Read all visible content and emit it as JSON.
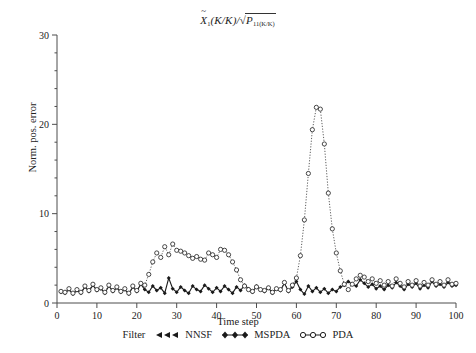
{
  "figure": {
    "title_plain": "X̂1(K/K)/√(P11(K/K))",
    "title_parts": {
      "var": "X",
      "var_sub": "1",
      "arg": "(K/K)/",
      "radical": "√",
      "rad_var": "P",
      "rad_sub": "11(K/K)"
    },
    "background_color": "#ffffff",
    "axis_color": "#4d4d4d"
  },
  "axes": {
    "xlabel": "Time step",
    "ylabel": "Norm. pos. error",
    "xticks": [
      0,
      10,
      20,
      30,
      40,
      50,
      60,
      70,
      80,
      90,
      100
    ],
    "yticks": [
      0,
      10,
      20,
      30
    ],
    "xlim": [
      0,
      100
    ],
    "ylim": [
      0,
      30
    ],
    "minor_tick_count_y": 5,
    "grid": "off"
  },
  "legend": {
    "prefix": "Filter",
    "entries": [
      {
        "marker": "triangle-left",
        "label": "NNSF",
        "color": "#1a1a1a"
      },
      {
        "marker": "diamond-filled",
        "label": "MSPDA",
        "color": "#1a1a1a"
      },
      {
        "marker": "circle-open",
        "label": "PDA",
        "color": "#1a1a1a"
      }
    ]
  },
  "chart_data": {
    "type": "line",
    "xlabel": "Time step",
    "ylabel": "Norm. pos. error",
    "xlim": [
      0,
      100
    ],
    "ylim": [
      0,
      30
    ],
    "xticks": [
      0,
      10,
      20,
      30,
      40,
      50,
      60,
      70,
      80,
      90,
      100
    ],
    "yticks": [
      0,
      10,
      20,
      30
    ],
    "grid": "off",
    "legend_position": "below-axes",
    "x": [
      1,
      2,
      3,
      4,
      5,
      6,
      7,
      8,
      9,
      10,
      11,
      12,
      13,
      14,
      15,
      16,
      17,
      18,
      19,
      20,
      21,
      22,
      23,
      24,
      25,
      26,
      27,
      28,
      29,
      30,
      31,
      32,
      33,
      34,
      35,
      36,
      37,
      38,
      39,
      40,
      41,
      42,
      43,
      44,
      45,
      46,
      47,
      48,
      49,
      50,
      51,
      52,
      53,
      54,
      55,
      56,
      57,
      58,
      59,
      60,
      61,
      62,
      63,
      64,
      65,
      66,
      67,
      68,
      69,
      70,
      71,
      72,
      73,
      74,
      75,
      76,
      77,
      78,
      79,
      80,
      81,
      82,
      83,
      84,
      85,
      86,
      87,
      88,
      89,
      90,
      91,
      92,
      93,
      94,
      95,
      96,
      97,
      98,
      99,
      100
    ],
    "series": [
      {
        "name": "MSPDA",
        "marker": "diamond-filled",
        "linestyle": "solid",
        "color": "#1a1a1a",
        "values": [
          1.2,
          1.1,
          1.5,
          1.0,
          1.4,
          1.1,
          1.8,
          1.3,
          2.0,
          1.4,
          1.6,
          1.1,
          1.9,
          1.3,
          1.7,
          1.2,
          1.5,
          1.0,
          1.8,
          1.3,
          2.1,
          1.5,
          1.2,
          1.9,
          1.4,
          1.7,
          1.1,
          2.8,
          1.6,
          1.2,
          1.8,
          1.4,
          1.1,
          1.9,
          1.5,
          1.3,
          2.0,
          1.6,
          1.2,
          1.7,
          1.3,
          1.9,
          1.5,
          1.1,
          1.8,
          1.4,
          2.0,
          1.6,
          1.2,
          1.9,
          1.5,
          1.3,
          1.7,
          1.1,
          1.6,
          1.4,
          2.2,
          1.3,
          1.8,
          2.4,
          1.5,
          1.0,
          1.9,
          1.3,
          1.7,
          1.2,
          1.6,
          1.1,
          1.5,
          1.3,
          1.8,
          2.0,
          2.4,
          2.1,
          1.9,
          2.6,
          2.2,
          1.8,
          2.1,
          1.6,
          1.9,
          1.5,
          2.0,
          1.7,
          2.3,
          1.9,
          1.5,
          2.1,
          1.8,
          2.2,
          1.6,
          2.0,
          1.7,
          2.4,
          1.9,
          2.1,
          1.8,
          2.3,
          1.9,
          2.0
        ]
      },
      {
        "name": "PDA",
        "marker": "circle-open",
        "linestyle": "dotted",
        "color": "#333333",
        "values": [
          1.3,
          1.2,
          1.6,
          1.1,
          1.5,
          1.2,
          1.9,
          1.4,
          2.1,
          1.5,
          1.7,
          1.2,
          2.0,
          1.4,
          1.8,
          1.3,
          1.6,
          1.1,
          1.9,
          1.4,
          2.2,
          2.0,
          3.2,
          4.6,
          5.6,
          5.1,
          6.3,
          5.4,
          6.6,
          5.9,
          5.8,
          5.6,
          5.3,
          5.0,
          5.2,
          4.9,
          4.8,
          5.6,
          5.4,
          5.1,
          6.0,
          5.9,
          5.4,
          4.6,
          3.7,
          2.6,
          1.9,
          1.5,
          1.3,
          1.8,
          1.5,
          1.4,
          1.7,
          1.2,
          1.6,
          1.5,
          2.3,
          1.4,
          2.0,
          2.8,
          5.3,
          9.3,
          14.5,
          19.4,
          21.9,
          21.7,
          17.8,
          12.3,
          8.3,
          5.6,
          3.6,
          2.1,
          1.5,
          2.1,
          2.7,
          3.1,
          2.9,
          2.4,
          2.7,
          2.2,
          2.5,
          2.0,
          2.4,
          1.9,
          2.7,
          2.2,
          1.8,
          2.4,
          2.0,
          2.5,
          1.9,
          2.3,
          2.0,
          2.6,
          2.1,
          2.4,
          2.0,
          2.6,
          2.1,
          2.2
        ]
      }
    ]
  }
}
